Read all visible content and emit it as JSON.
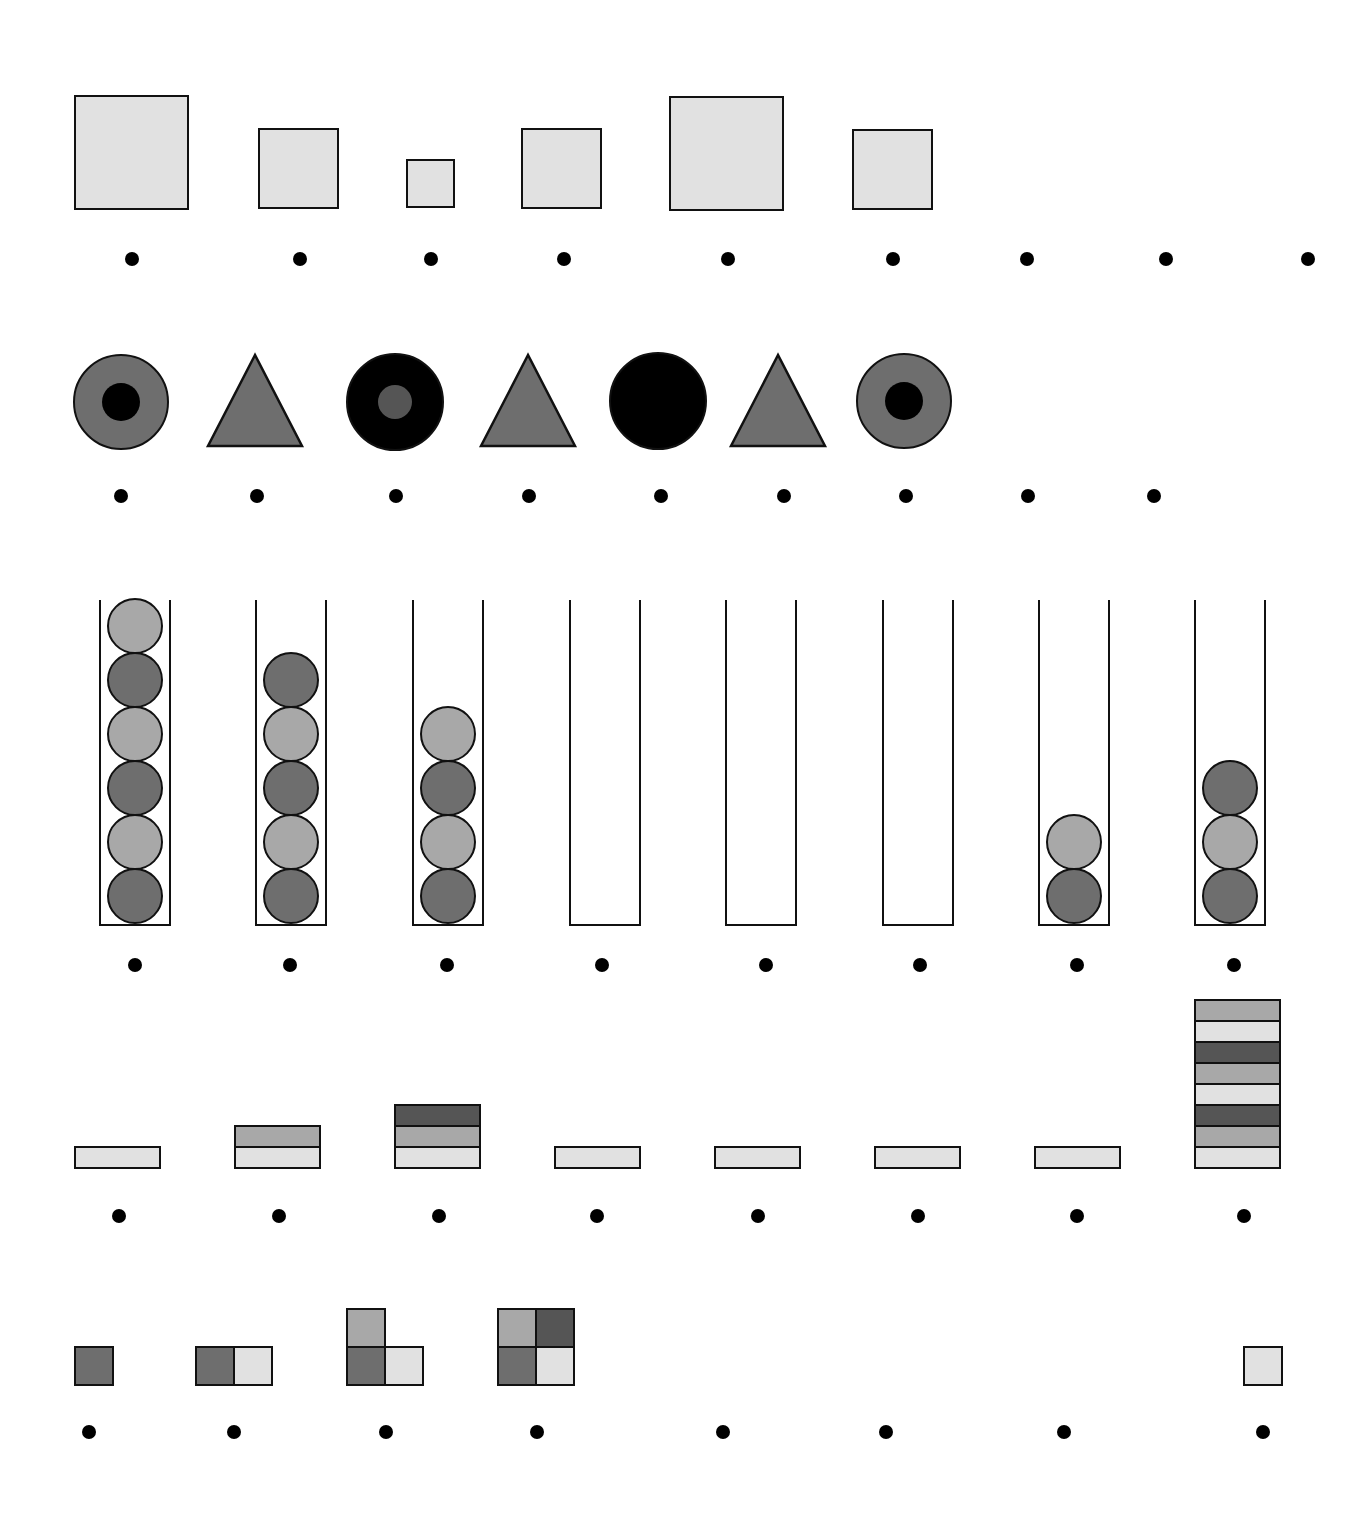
{
  "colors": {
    "light": "#e1e1e1",
    "mid": "#a8a8a8",
    "dark": "#6e6e6e",
    "darker": "#555555",
    "black": "#000000",
    "stroke": "#111111"
  },
  "rows": {
    "squares": {
      "items": [
        {
          "x": 74,
          "y": 95,
          "size": 115
        },
        {
          "x": 258,
          "y": 128,
          "size": 81
        },
        {
          "x": 406,
          "y": 159,
          "size": 49
        },
        {
          "x": 521,
          "y": 128,
          "size": 81
        },
        {
          "x": 669,
          "y": 96,
          "size": 115
        },
        {
          "x": 852,
          "y": 129,
          "size": 81
        }
      ],
      "dots_y": 259,
      "dots_x": [
        132,
        300,
        431,
        564,
        728,
        893,
        1027,
        1166,
        1308
      ]
    },
    "shapes": {
      "items": [
        {
          "type": "ring",
          "cx": 121,
          "cy": 402,
          "r": 47,
          "outer": "dark",
          "inner": "black",
          "ir": 19
        },
        {
          "type": "triangle",
          "cx": 255,
          "top": 355,
          "bottom": 446,
          "half": 47,
          "fill": "dark"
        },
        {
          "type": "ring",
          "cx": 395,
          "cy": 402,
          "r": 48,
          "outer": "black",
          "inner": "darker",
          "ir": 17
        },
        {
          "type": "triangle",
          "cx": 528,
          "top": 355,
          "bottom": 446,
          "half": 47,
          "fill": "dark"
        },
        {
          "type": "disc",
          "cx": 658,
          "cy": 401,
          "r": 48,
          "fill": "black"
        },
        {
          "type": "triangle",
          "cx": 778,
          "top": 355,
          "bottom": 446,
          "half": 47,
          "fill": "dark"
        },
        {
          "type": "ring",
          "cx": 904,
          "cy": 401,
          "r": 47,
          "outer": "dark",
          "inner": "black",
          "ir": 19
        }
      ],
      "dots_y": 496,
      "dots_x": [
        121,
        257,
        396,
        529,
        661,
        784,
        906,
        1028,
        1154
      ]
    },
    "tubes": {
      "top": 600,
      "bottom": 926,
      "width": 72,
      "ball_d": 56,
      "items": [
        {
          "x": 99,
          "balls": [
            "dark",
            "mid",
            "dark",
            "mid",
            "dark",
            "mid"
          ]
        },
        {
          "x": 255,
          "balls": [
            "dark",
            "mid",
            "dark",
            "mid",
            "dark"
          ]
        },
        {
          "x": 412,
          "balls": [
            "dark",
            "mid",
            "dark",
            "mid"
          ]
        },
        {
          "x": 569,
          "balls": []
        },
        {
          "x": 725,
          "balls": []
        },
        {
          "x": 882,
          "balls": []
        },
        {
          "x": 1038,
          "balls": [
            "dark",
            "mid"
          ]
        },
        {
          "x": 1194,
          "balls": [
            "dark",
            "mid",
            "dark"
          ]
        }
      ],
      "dots_y": 965,
      "dots_x": [
        135,
        290,
        447,
        602,
        766,
        920,
        1077,
        1234
      ]
    },
    "stacks": {
      "bottom": 1167,
      "layer_h": 21,
      "width": 87,
      "items": [
        {
          "x": 74,
          "layers": [
            "light"
          ]
        },
        {
          "x": 234,
          "layers": [
            "light",
            "mid"
          ]
        },
        {
          "x": 394,
          "layers": [
            "light",
            "mid",
            "darker"
          ]
        },
        {
          "x": 554,
          "layers": [
            "light"
          ]
        },
        {
          "x": 714,
          "layers": [
            "light"
          ]
        },
        {
          "x": 874,
          "layers": [
            "light"
          ]
        },
        {
          "x": 1034,
          "layers": [
            "light"
          ]
        },
        {
          "x": 1194,
          "layers": [
            "light",
            "mid",
            "darker",
            "light",
            "mid",
            "darker",
            "light",
            "mid"
          ]
        }
      ],
      "dots_y": 1216,
      "dots_x": [
        119,
        279,
        439,
        597,
        758,
        918,
        1077,
        1244
      ]
    },
    "grids": {
      "cell": 38,
      "bottom": 1384,
      "items": [
        {
          "x": 74,
          "cells": [
            {
              "c": 0,
              "r": 0,
              "fill": "dark"
            }
          ]
        },
        {
          "x": 195,
          "cells": [
            {
              "c": 0,
              "r": 0,
              "fill": "dark"
            },
            {
              "c": 1,
              "r": 0,
              "fill": "light"
            }
          ]
        },
        {
          "x": 346,
          "cells": [
            {
              "c": 0,
              "r": 0,
              "fill": "dark"
            },
            {
              "c": 1,
              "r": 0,
              "fill": "light"
            },
            {
              "c": 0,
              "r": 1,
              "fill": "mid"
            }
          ]
        },
        {
          "x": 497,
          "cells": [
            {
              "c": 0,
              "r": 0,
              "fill": "dark"
            },
            {
              "c": 1,
              "r": 0,
              "fill": "light"
            },
            {
              "c": 0,
              "r": 1,
              "fill": "mid"
            },
            {
              "c": 1,
              "r": 1,
              "fill": "darker"
            }
          ]
        },
        {
          "x": 1243,
          "cells": [
            {
              "c": 0,
              "r": 0,
              "fill": "light"
            }
          ]
        }
      ],
      "dots_y": 1432,
      "dots_x": [
        89,
        234,
        386,
        537,
        723,
        886,
        1064,
        1263
      ]
    }
  }
}
